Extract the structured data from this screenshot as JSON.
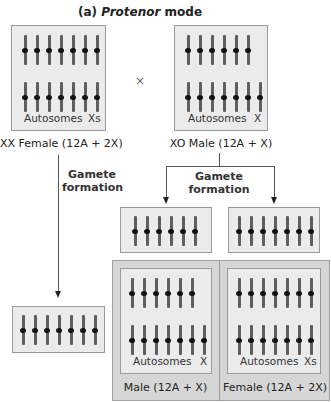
{
  "title": {
    "prefix": "(a) ",
    "italic": "Protenor",
    "suffix": " mode"
  },
  "cross_symbol": "×",
  "parents": {
    "female": {
      "caption": "XX Female (12A + 2X)",
      "label_autosomes": "Autosomes",
      "label_sex": "Xs",
      "top_row_count": 7,
      "bottom_row_count": 7
    },
    "male": {
      "caption": "XO Male (12A + X)",
      "label_autosomes": "Autosomes",
      "label_sex": "X",
      "top_row_count": 6,
      "bottom_row_count": 7
    }
  },
  "gamete_formation_label_line1": "Gamete",
  "gamete_formation_label_line2": "formation",
  "gametes": {
    "female": {
      "chromosome_count": 7
    },
    "male_a": {
      "chromosome_count": 6
    },
    "male_b": {
      "chromosome_count": 7
    }
  },
  "offspring": {
    "male": {
      "caption": "Male (12A + X)",
      "label_autosomes": "Autosomes",
      "label_sex": "X",
      "top_row_count": 6,
      "bottom_row_count": 7
    },
    "female": {
      "caption": "Female (12A + 2X)",
      "label_autosomes": "Autosomes",
      "label_sex": "Xs",
      "top_row_count": 7,
      "bottom_row_count": 7
    }
  },
  "colors": {
    "box_fill": "#ebebeb",
    "panel_fill": "#d6d6d6",
    "chromosome": "#5e5e5e",
    "centromere": "#111111"
  }
}
